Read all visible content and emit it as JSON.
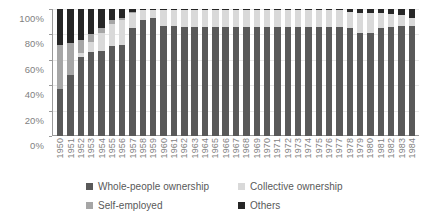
{
  "chart_data": {
    "type": "bar",
    "subtype": "stacked-percentage-column",
    "title": "",
    "xlabel": "",
    "ylabel": "",
    "ylim": [
      0,
      100
    ],
    "ytick_labels": [
      "100%",
      "80%",
      "60%",
      "40%",
      "20%",
      "0%"
    ],
    "ytick_values": [
      100,
      80,
      60,
      40,
      20,
      0
    ],
    "grid": true,
    "legend_position": "bottom",
    "categories": [
      "1950",
      "1951",
      "1952",
      "1953",
      "1954",
      "1955",
      "1956",
      "1957",
      "1958",
      "1959",
      "1960",
      "1961",
      "1962",
      "1963",
      "1964",
      "1965",
      "1966",
      "1967",
      "1968",
      "1969",
      "1970",
      "1971",
      "1972",
      "1973",
      "1974",
      "1975",
      "1976",
      "1977",
      "1978",
      "1979",
      "1980",
      "1981",
      "1982",
      "1983",
      "1984"
    ],
    "series": [
      {
        "name": "Whole-people ownership",
        "color": "#595959",
        "values": [
          37,
          48,
          62,
          66,
          67,
          71,
          72,
          85,
          91,
          93,
          87,
          87,
          86,
          86,
          86,
          86,
          86,
          86,
          86,
          86,
          86,
          86,
          86,
          86,
          86,
          86,
          86,
          86,
          85,
          81,
          81,
          85,
          86,
          87,
          87
        ]
      },
      {
        "name": "Collective ownership",
        "color": "#d9d9d9",
        "values": [
          0,
          0,
          3,
          8,
          14,
          17,
          19,
          12,
          8,
          6,
          12,
          12,
          13,
          13,
          13,
          13,
          13,
          13,
          13,
          13,
          13,
          13,
          13,
          13,
          13,
          13,
          13,
          13,
          13,
          16,
          16,
          12,
          10,
          8,
          6
        ]
      },
      {
        "name": "Self-employed",
        "color": "#a6a6a6",
        "values": [
          35,
          25,
          11,
          6,
          4,
          3,
          2,
          1,
          0,
          0,
          0,
          0,
          0,
          0,
          0,
          0,
          0,
          0,
          0,
          0,
          0,
          0,
          0,
          0,
          0,
          0,
          0,
          0,
          0,
          0,
          0,
          0,
          0,
          0,
          0
        ]
      },
      {
        "name": "Others",
        "color": "#262626",
        "values": [
          28,
          27,
          24,
          20,
          15,
          9,
          7,
          2,
          1,
          1,
          1,
          1,
          1,
          1,
          1,
          1,
          1,
          1,
          1,
          1,
          1,
          1,
          1,
          1,
          1,
          1,
          1,
          1,
          2,
          3,
          3,
          3,
          4,
          5,
          7
        ]
      }
    ]
  },
  "legend": {
    "items": [
      {
        "label": "Whole-people ownership",
        "color": "#595959"
      },
      {
        "label": "Collective ownership",
        "color": "#d9d9d9"
      },
      {
        "label": "Self-employed",
        "color": "#a6a6a6"
      },
      {
        "label": "Others",
        "color": "#262626"
      }
    ]
  },
  "axis_colors": {
    "axis_line": "#9a9a9a",
    "gridline": "#e8e8e8",
    "tick_text": "#7f7f7f"
  }
}
